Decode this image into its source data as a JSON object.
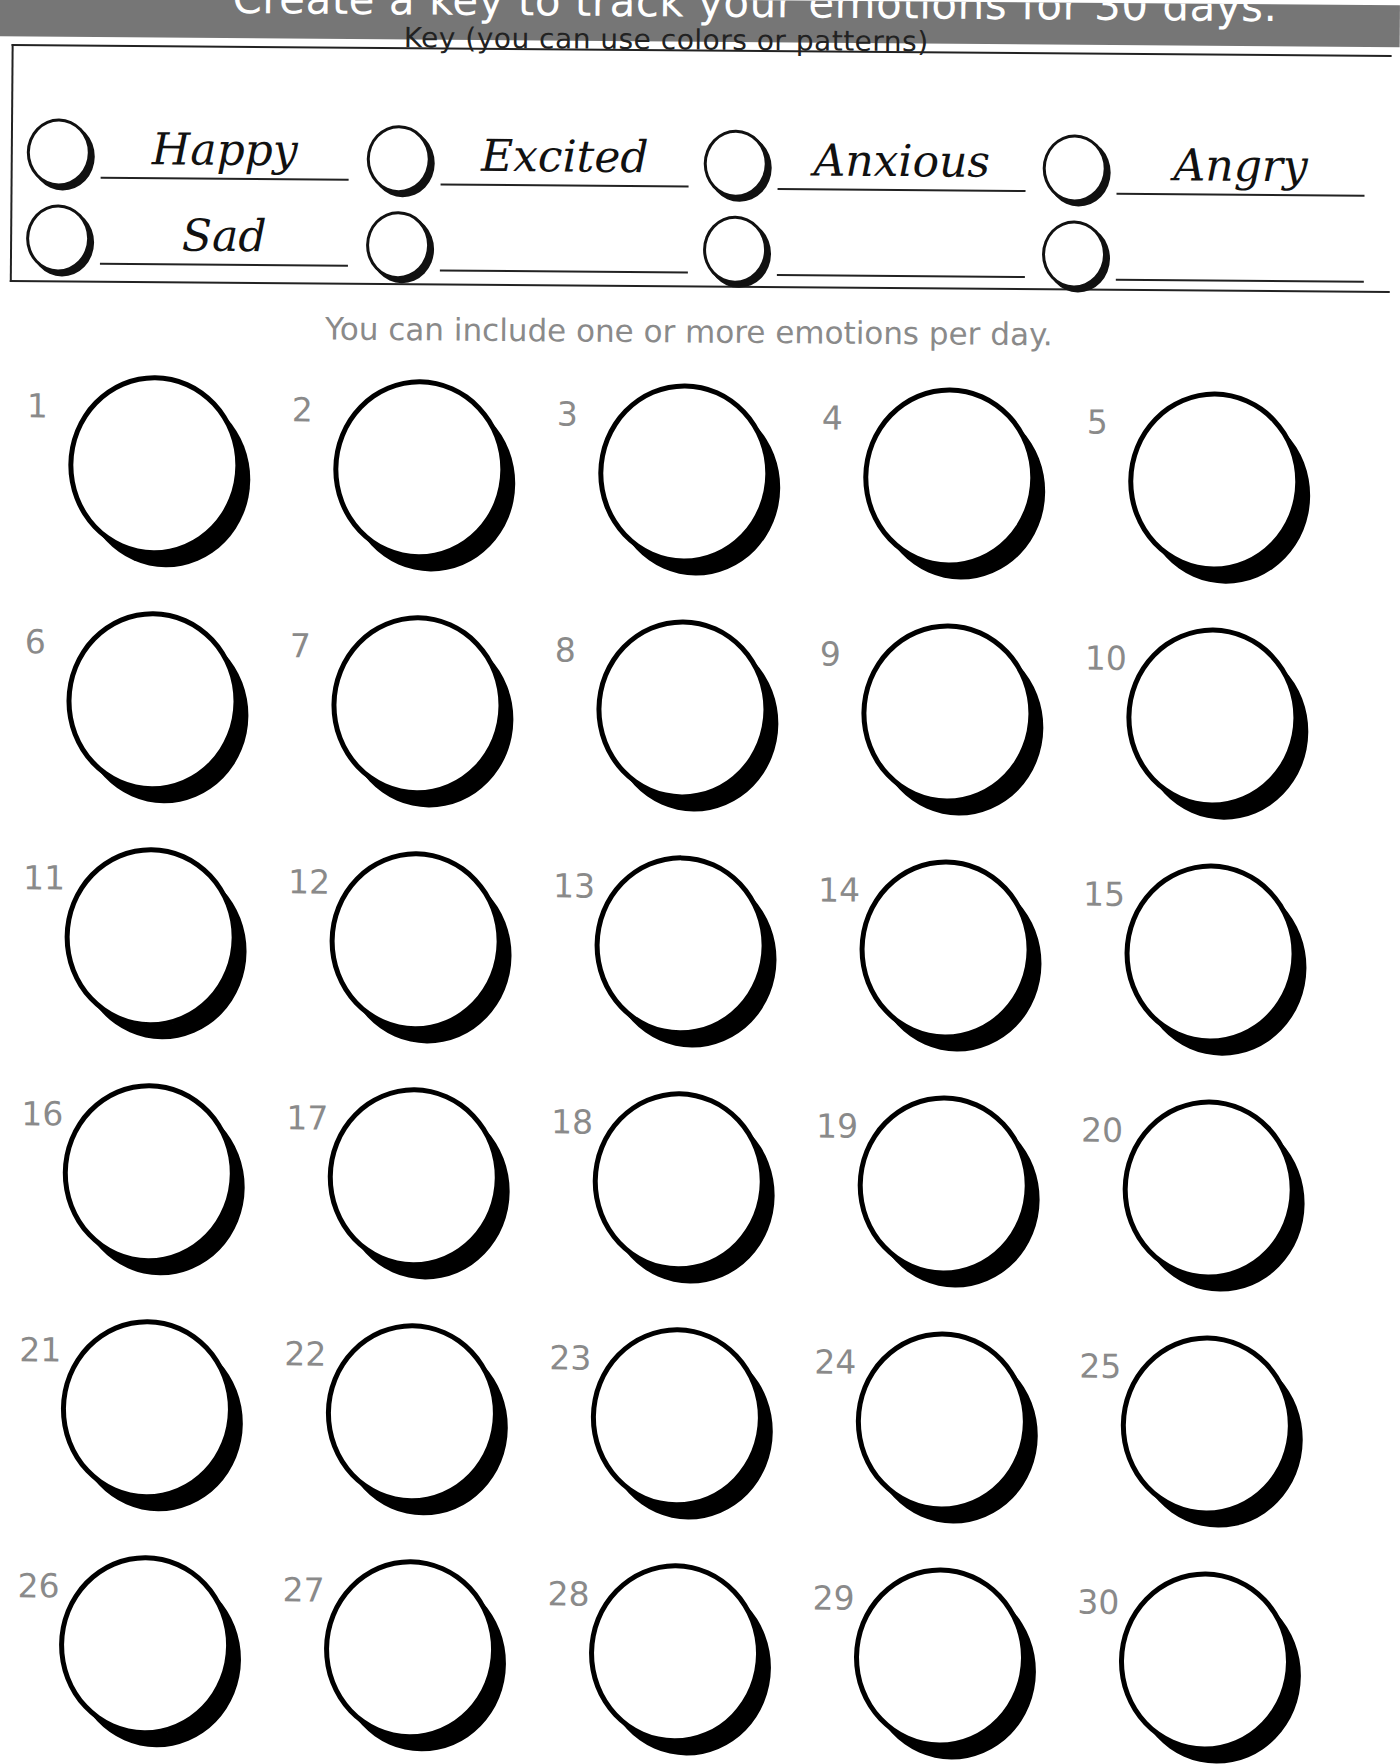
{
  "header": {
    "banner_text": "Create a key to track your emotions for 30 days.",
    "banner_color": "#767676"
  },
  "key": {
    "title": "Key (you can use colors or patterns)",
    "items": [
      {
        "label": "Happy"
      },
      {
        "label": "Excited"
      },
      {
        "label": "Anxious"
      },
      {
        "label": "Angry"
      },
      {
        "label": "Sad"
      },
      {
        "label": ""
      },
      {
        "label": ""
      },
      {
        "label": ""
      }
    ]
  },
  "instructions": "You can include one or more emotions per day.",
  "days": [
    {
      "number": "1"
    },
    {
      "number": "2"
    },
    {
      "number": "3"
    },
    {
      "number": "4"
    },
    {
      "number": "5"
    },
    {
      "number": "6"
    },
    {
      "number": "7"
    },
    {
      "number": "8"
    },
    {
      "number": "9"
    },
    {
      "number": "10"
    },
    {
      "number": "11"
    },
    {
      "number": "12"
    },
    {
      "number": "13"
    },
    {
      "number": "14"
    },
    {
      "number": "15"
    },
    {
      "number": "16"
    },
    {
      "number": "17"
    },
    {
      "number": "18"
    },
    {
      "number": "19"
    },
    {
      "number": "20"
    },
    {
      "number": "21"
    },
    {
      "number": "22"
    },
    {
      "number": "23"
    },
    {
      "number": "24"
    },
    {
      "number": "25"
    },
    {
      "number": "26"
    },
    {
      "number": "27"
    },
    {
      "number": "28"
    },
    {
      "number": "29"
    },
    {
      "number": "30"
    }
  ]
}
